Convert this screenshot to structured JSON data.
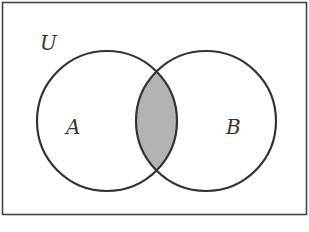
{
  "diagram": {
    "type": "venn",
    "universe_label": "U",
    "sets": [
      {
        "id": "A",
        "label": "A"
      },
      {
        "id": "B",
        "label": "B"
      }
    ],
    "shaded_region": "A ∩ B",
    "colors": {
      "stroke": "#333333",
      "shade": "#b3b3b3",
      "frame": "#444444",
      "background": "#ffffff"
    }
  }
}
